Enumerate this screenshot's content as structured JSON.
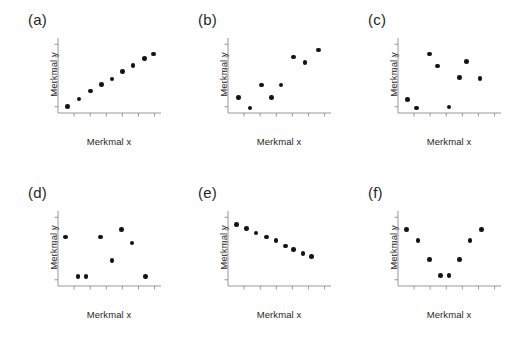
{
  "figure": {
    "background_color": "#ffffff",
    "marker_color": "#131313",
    "axis_color": "#8c8c8c",
    "text_color": "#1f1f1f",
    "xlabel": "Merkmal x",
    "ylabel": "Merkmal y"
  },
  "chart_data": [
    {
      "type": "scatter",
      "title": "(a)",
      "xlabel": "Merkmal x",
      "ylabel": "Merkmal y",
      "xlim": [
        0,
        10
      ],
      "ylim": [
        0,
        10
      ],
      "grid": false,
      "legend": "none",
      "annotation": "strong positive linear correlation",
      "x": [
        1.0,
        2.1,
        3.2,
        4.3,
        5.3,
        6.3,
        7.3,
        8.4,
        9.3
      ],
      "y": [
        1.0,
        2.0,
        3.0,
        3.9,
        4.6,
        5.6,
        6.4,
        7.3,
        7.9
      ]
    },
    {
      "type": "scatter",
      "title": "(b)",
      "xlabel": "Merkmal x",
      "ylabel": "Merkmal y",
      "xlim": [
        0,
        10
      ],
      "ylim": [
        0,
        10
      ],
      "grid": false,
      "legend": "none",
      "annotation": "moderate positive correlation",
      "x": [
        1.1,
        2.2,
        3.3,
        4.3,
        5.2,
        6.4,
        7.5,
        8.8
      ],
      "y": [
        2.2,
        0.8,
        3.8,
        2.2,
        3.8,
        7.5,
        6.8,
        8.4
      ]
    },
    {
      "type": "scatter",
      "title": "(c)",
      "xlabel": "Merkmal x",
      "ylabel": "Merkmal y",
      "xlim": [
        0,
        10
      ],
      "ylim": [
        0,
        10
      ],
      "grid": false,
      "legend": "none",
      "annotation": "no correlation",
      "x": [
        1.0,
        1.9,
        3.1,
        3.9,
        5.0,
        6.0,
        6.7,
        8.0
      ],
      "y": [
        1.9,
        0.8,
        7.9,
        6.3,
        0.9,
        4.8,
        6.9,
        4.7
      ]
    },
    {
      "type": "scatter",
      "title": "(d)",
      "xlabel": "Merkmal x",
      "ylabel": "Merkmal y",
      "xlim": [
        0,
        10
      ],
      "ylim": [
        0,
        10
      ],
      "grid": false,
      "legend": "none",
      "annotation": "no correlation, scattered",
      "x": [
        0.8,
        2.0,
        2.8,
        4.2,
        5.3,
        6.2,
        7.2,
        8.5
      ],
      "y": [
        6.6,
        1.4,
        1.4,
        6.6,
        3.5,
        7.6,
        5.8,
        1.4
      ]
    },
    {
      "type": "scatter",
      "title": "(e)",
      "xlabel": "Merkmal x",
      "ylabel": "Merkmal y",
      "xlim": [
        0,
        10
      ],
      "ylim": [
        0,
        10
      ],
      "grid": false,
      "legend": "none",
      "annotation": "strong negative correlation",
      "x": [
        0.9,
        1.9,
        2.8,
        3.8,
        4.7,
        5.6,
        6.4,
        7.3,
        8.1
      ],
      "y": [
        8.2,
        7.7,
        7.1,
        6.6,
        6.1,
        5.4,
        4.9,
        4.4,
        4.0
      ]
    },
    {
      "type": "scatter",
      "title": "(f)",
      "xlabel": "Merkmal x",
      "ylabel": "Merkmal y",
      "xlim": [
        0,
        10
      ],
      "ylim": [
        0,
        10
      ],
      "grid": false,
      "legend": "none",
      "annotation": "non-linear (U-shaped) relationship",
      "x": [
        0.9,
        2.0,
        3.1,
        4.2,
        5.0,
        6.0,
        7.0,
        8.1
      ],
      "y": [
        7.6,
        6.1,
        3.6,
        1.5,
        1.5,
        3.6,
        6.1,
        7.6
      ]
    }
  ]
}
